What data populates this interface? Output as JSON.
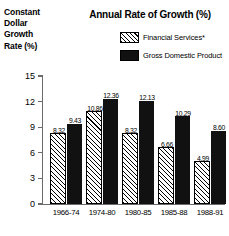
{
  "chart_data": {
    "type": "bar",
    "title": "Annual Rate of Growth (%)",
    "ylabel_lines": [
      "Constant",
      "Dollar",
      "Growth",
      "Rate (%)"
    ],
    "xlabel": "",
    "categories": [
      "1966-74",
      "1974-80",
      "1980-85",
      "1985-88",
      "1988-91"
    ],
    "series": [
      {
        "name": "Financial Services*",
        "values": [
          8.32,
          10.86,
          8.32,
          6.66,
          4.99
        ],
        "style": "hatched",
        "color": "#ffffff"
      },
      {
        "name": "Gross Domestic Product",
        "values": [
          9.43,
          12.36,
          12.13,
          10.29,
          8.6
        ],
        "style": "solid",
        "color": "#111111"
      }
    ],
    "ylim": [
      0,
      15
    ],
    "yticks": [
      0,
      3,
      6,
      9,
      12,
      15
    ],
    "ytick_labels": [
      "0",
      "3",
      "6",
      "9",
      "12",
      "15"
    ],
    "value_labels": [
      [
        "8.32",
        "9.43"
      ],
      [
        "10.86",
        "12.36"
      ],
      [
        "8.32",
        "12.13"
      ],
      [
        "6.66",
        "10.29"
      ],
      [
        "4.99",
        "8.60"
      ]
    ],
    "grid": false,
    "legend_position": "top-right"
  }
}
